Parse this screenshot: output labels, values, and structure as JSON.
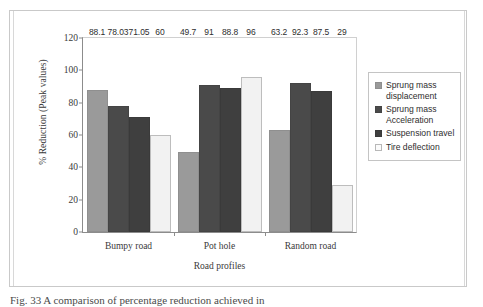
{
  "figure": {
    "caption": "Fig. 33 A comparison of percentage reduction achieved in"
  },
  "chart_data": {
    "type": "bar",
    "title": "",
    "xlabel": "Road profiles",
    "ylabel": "% Reduction (Peak values)",
    "categories": [
      "Bumpy road",
      "Pot hole",
      "Random road"
    ],
    "series": [
      {
        "name": "Sprung mass displacement",
        "color": "#9a9a9a",
        "values": [
          88.1,
          49.7,
          63.2
        ],
        "labels": [
          "88.1",
          "49.7",
          "63.2"
        ]
      },
      {
        "name": "Sprung mass Acceleration",
        "color": "#4a4a4a",
        "values": [
          78.03,
          91,
          92.3
        ],
        "labels": [
          "78.03",
          "91",
          "92.3"
        ]
      },
      {
        "name": "Suspension travel",
        "color": "#3f3f3f",
        "values": [
          71.05,
          88.8,
          87.5
        ],
        "labels": [
          "71.05",
          "88.8",
          "87.5"
        ]
      },
      {
        "name": "Tire deflection",
        "color": "#f2f2f2",
        "values": [
          60,
          96,
          29
        ],
        "labels": [
          "60",
          "96",
          "29"
        ]
      }
    ],
    "ylim": [
      0,
      120
    ],
    "yticks": [
      0,
      20,
      40,
      60,
      80,
      100,
      120
    ],
    "ytick_labels": [
      "0",
      "20",
      "40",
      "60",
      "80",
      "100",
      "120"
    ],
    "grid": false,
    "legend_position": "right"
  }
}
